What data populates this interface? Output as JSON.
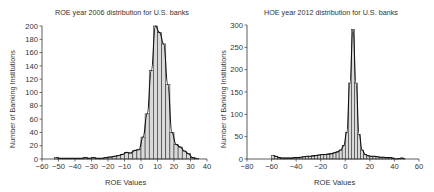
{
  "chart_data": [
    {
      "type": "bar",
      "title": "ROE year 2006 distribution for U.S. banks",
      "xlabel": "ROE Values",
      "ylabel": "Number of Banking Institutions",
      "xlim": [
        -60,
        40
      ],
      "ylim": [
        0,
        200
      ],
      "xticks": [
        -60,
        -50,
        -40,
        -30,
        -20,
        -10,
        0,
        10,
        20,
        30,
        40
      ],
      "yticks": [
        0,
        20,
        40,
        60,
        80,
        100,
        120,
        140,
        160,
        180,
        200
      ],
      "grid": false,
      "bin_width": 2.5,
      "bins_left_edge": [
        -52.5,
        -50,
        -47.5,
        -45,
        -42.5,
        -40,
        -37.5,
        -35,
        -32.5,
        -30,
        -27.5,
        -25,
        -22.5,
        -20,
        -17.5,
        -15,
        -12.5,
        -10,
        -7.5,
        -5,
        -2.5,
        0,
        2.5,
        5,
        7.5,
        10,
        12.5,
        15,
        17.5,
        20,
        22.5,
        25,
        27.5,
        30,
        32.5
      ],
      "values": [
        2,
        1,
        1,
        1,
        1,
        1,
        1,
        2,
        1,
        2,
        1,
        1,
        2,
        3,
        4,
        5,
        7,
        10,
        9,
        13,
        14,
        33,
        68,
        133,
        200,
        190,
        173,
        112,
        40,
        22,
        18,
        12,
        8,
        2,
        1
      ],
      "fit_curve": "smooth density overlay",
      "bar_fill": "#d9d9d9"
    },
    {
      "type": "bar",
      "title": "HOE year 2012 distribution for U.S. banks",
      "xlabel": "ROE Values",
      "ylabel": "Number of Banking Institutions",
      "xlim": [
        -80,
        60
      ],
      "ylim": [
        0,
        300
      ],
      "xticks": [
        -80,
        -60,
        -40,
        -20,
        0,
        20,
        40,
        60
      ],
      "yticks": [
        0,
        50,
        100,
        150,
        200,
        250,
        300
      ],
      "grid": false,
      "bin_width": 2.5,
      "bins_left_edge": [
        -60,
        -57.5,
        -55,
        -52.5,
        -50,
        -47.5,
        -45,
        -42.5,
        -40,
        -37.5,
        -35,
        -32.5,
        -30,
        -27.5,
        -25,
        -22.5,
        -20,
        -17.5,
        -15,
        -12.5,
        -10,
        -7.5,
        -5,
        -2.5,
        0,
        2.5,
        5,
        7.5,
        10,
        12.5,
        15,
        17.5,
        20,
        22.5,
        25,
        27.5,
        30,
        32.5,
        35,
        37.5,
        40,
        42.5,
        45,
        47.5
      ],
      "values": [
        8,
        6,
        3,
        2,
        2,
        2,
        2,
        3,
        3,
        4,
        5,
        6,
        6,
        7,
        8,
        9,
        10,
        10,
        11,
        12,
        14,
        16,
        20,
        30,
        60,
        170,
        290,
        170,
        55,
        20,
        10,
        7,
        6,
        6,
        5,
        4,
        4,
        3,
        3,
        2,
        0,
        1,
        2,
        0
      ],
      "fit_curve": "smooth density overlay",
      "bar_fill": "#d9d9d9"
    }
  ],
  "left": {
    "title": "ROE year 2006 distribution for U.S. banks",
    "xlabel": "ROE Values",
    "ylabel": "Number of Banking Institutions"
  },
  "right": {
    "title": "HOE year 2012 distribution for U.S. banks",
    "xlabel": "ROE Values",
    "ylabel": "Number of Banking Institutions"
  }
}
